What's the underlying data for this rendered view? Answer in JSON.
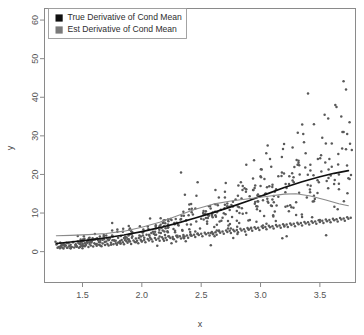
{
  "chart_data": {
    "type": "scatter",
    "title": "",
    "xlabel": "x",
    "ylabel": "y",
    "xlim": [
      1.18,
      3.8
    ],
    "ylim": [
      -8,
      63
    ],
    "grid": false,
    "xticks": [
      "1.5",
      "2.0",
      "2.5",
      "3.0",
      "3.5"
    ],
    "xtick_values": [
      1.5,
      2.0,
      2.5,
      3.0,
      3.5
    ],
    "yticks": [
      "0",
      "10",
      "20",
      "30",
      "40",
      "50",
      "60"
    ],
    "ytick_values": [
      0,
      10,
      20,
      30,
      40,
      50,
      60
    ],
    "legend": {
      "position": "top-left",
      "entries": [
        {
          "label": "True Derivative of Cond Mean",
          "color": "#101010",
          "marker": "square"
        },
        {
          "label": "Est Derivative of Cond Mean",
          "color": "#7a7a7a",
          "marker": "square"
        }
      ]
    },
    "point_color": "#595959",
    "point_radius": 1.25,
    "series": [
      {
        "name": "True Derivative of Cond Mean",
        "type": "line",
        "color": "#101010",
        "width": 1.7,
        "x": [
          1.28,
          1.4,
          1.55,
          1.7,
          1.85,
          2.0,
          2.15,
          2.3,
          2.45,
          2.6,
          2.75,
          2.9,
          3.05,
          3.2,
          3.35,
          3.5,
          3.62,
          3.74
        ],
        "y": [
          2.1,
          2.5,
          3.0,
          3.6,
          4.3,
          5.2,
          6.2,
          7.4,
          8.7,
          10.1,
          11.6,
          13.2,
          14.9,
          16.6,
          18.1,
          19.4,
          20.3,
          21.0
        ]
      },
      {
        "name": "Est Derivative of Cond Mean",
        "type": "line",
        "color": "#8a8a8a",
        "width": 1.1,
        "x": [
          1.28,
          1.4,
          1.55,
          1.7,
          1.85,
          2.0,
          2.15,
          2.3,
          2.45,
          2.6,
          2.75,
          2.9,
          3.05,
          3.2,
          3.3,
          3.42,
          3.55,
          3.66,
          3.74
        ],
        "y": [
          4.1,
          4.2,
          4.4,
          4.7,
          5.3,
          6.3,
          7.6,
          9.3,
          11.0,
          12.3,
          13.1,
          13.7,
          14.3,
          14.9,
          15.0,
          14.4,
          13.4,
          12.4,
          11.9
        ]
      }
    ],
    "scatter": {
      "n": 500,
      "description": "Heteroscedastic fan: spread increases with x",
      "x": [
        1.29,
        1.3,
        1.31,
        1.32,
        1.33,
        1.34,
        1.34,
        1.35,
        1.36,
        1.37,
        1.38,
        1.39,
        1.4,
        1.4,
        1.41,
        1.42,
        1.43,
        1.44,
        1.45,
        1.46,
        1.47,
        1.48,
        1.49,
        1.5,
        1.5,
        1.51,
        1.52,
        1.53,
        1.54,
        1.55,
        1.56,
        1.57,
        1.58,
        1.59,
        1.6,
        1.61,
        1.62,
        1.63,
        1.64,
        1.65,
        1.66,
        1.67,
        1.68,
        1.69,
        1.7,
        1.71,
        1.72,
        1.73,
        1.74,
        1.75,
        1.76,
        1.77,
        1.78,
        1.79,
        1.8,
        1.81,
        1.82,
        1.83,
        1.84,
        1.85,
        1.86,
        1.87,
        1.88,
        1.89,
        1.9,
        1.91,
        1.92,
        1.93,
        1.94,
        1.95,
        1.96,
        1.97,
        1.98,
        1.99,
        2.0,
        2.01,
        2.02,
        2.03,
        2.04,
        2.05,
        2.06,
        2.07,
        2.08,
        2.09,
        2.1,
        2.11,
        2.12,
        2.13,
        2.14,
        2.15,
        2.16,
        2.17,
        2.18,
        2.19,
        2.2,
        2.21,
        2.22,
        2.23,
        2.24,
        2.25,
        2.26,
        2.27,
        2.28,
        2.29,
        2.3,
        2.31,
        2.32,
        2.33,
        2.34,
        2.35,
        2.36,
        2.37,
        2.38,
        2.39,
        2.4,
        2.41,
        2.42,
        2.43,
        2.44,
        2.45,
        2.46,
        2.47,
        2.48,
        2.49,
        2.5,
        2.51,
        2.52,
        2.53,
        2.54,
        2.55,
        2.56,
        2.57,
        2.58,
        2.59,
        2.6,
        2.61,
        2.62,
        2.63,
        2.64,
        2.65,
        2.66,
        2.67,
        2.68,
        2.69,
        2.7,
        2.71,
        2.72,
        2.73,
        2.74,
        2.75,
        2.76,
        2.77,
        2.78,
        2.79,
        2.8,
        2.81,
        2.82,
        2.83,
        2.84,
        2.85,
        2.86,
        2.87,
        2.88,
        2.89,
        2.9,
        2.91,
        2.92,
        2.93,
        2.94,
        2.95,
        2.96,
        2.97,
        2.98,
        2.99,
        3.0,
        3.01,
        3.02,
        3.03,
        3.04,
        3.05,
        3.06,
        3.07,
        3.08,
        3.09,
        3.1,
        3.11,
        3.12,
        3.13,
        3.14,
        3.15,
        3.16,
        3.17,
        3.18,
        3.19,
        3.2,
        3.21,
        3.22,
        3.23,
        3.24,
        3.25,
        3.26,
        3.27,
        3.28,
        3.29,
        3.3,
        3.31,
        3.32,
        3.33,
        3.34,
        3.35,
        3.36,
        3.37,
        3.38,
        3.39,
        3.4,
        3.41,
        3.42,
        3.43,
        3.44,
        3.45,
        3.46,
        3.47,
        3.48,
        3.49,
        3.5,
        3.51,
        3.52,
        3.53,
        3.54,
        3.55,
        3.56,
        3.57,
        3.58,
        3.59,
        3.6,
        3.61,
        3.62,
        3.63,
        3.64,
        3.65,
        3.66,
        3.67,
        3.68,
        3.69,
        3.7,
        3.71,
        3.72,
        3.73,
        3.74,
        3.75,
        3.76
      ],
      "y": [
        1.0,
        1.2,
        0.9,
        1.5,
        1.1,
        2.0,
        0.8,
        1.3,
        1.6,
        1.0,
        2.2,
        1.4,
        0.9,
        1.8,
        1.2,
        2.4,
        1.1,
        1.7,
        1.3,
        2.6,
        1.0,
        1.9,
        1.5,
        2.1,
        0.9,
        2.8,
        1.4,
        1.8,
        2.3,
        1.2,
        2.0,
        1.6,
        2.9,
        1.3,
        2.2,
        1.9,
        1.5,
        3.0,
        1.8,
        2.4,
        1.4,
        2.1,
        3.2,
        1.7,
        2.6,
        2.0,
        1.6,
        3.4,
        2.3,
        7.4,
        1.9,
        2.8,
        2.2,
        1.8,
        3.6,
        2.5,
        2.1,
        3.0,
        2.4,
        1.9,
        3.8,
        2.7,
        2.3,
        3.2,
        2.6,
        2.0,
        4.0,
        2.9,
        2.5,
        3.4,
        2.8,
        2.2,
        4.2,
        3.1,
        2.7,
        5.0,
        3.0,
        2.4,
        4.4,
        3.3,
        2.9,
        3.6,
        3.2,
        2.6,
        4.6,
        3.5,
        3.1,
        1.5,
        3.4,
        2.8,
        4.8,
        3.7,
        3.3,
        5.2,
        3.6,
        3.0,
        8.3,
        3.9,
        3.5,
        2.2,
        3.8,
        3.2,
        5.4,
        4.1,
        3.7,
        6.8,
        4.0,
        3.4,
        5.6,
        4.3,
        3.9,
        2.7,
        4.2,
        3.6,
        5.8,
        4.5,
        4.1,
        9.6,
        4.4,
        3.8,
        14.5,
        4.7,
        4.3,
        6.0,
        4.6,
        4.0,
        10.5,
        4.9,
        4.5,
        7.2,
        4.8,
        4.2,
        11.2,
        5.1,
        4.7,
        6.4,
        5.0,
        4.4,
        12.0,
        5.3,
        4.9,
        8.0,
        5.2,
        4.6,
        15.5,
        5.5,
        5.1,
        6.8,
        5.4,
        4.8,
        9.0,
        5.7,
        5.3,
        13.5,
        5.6,
        5.0,
        7.4,
        5.9,
        5.5,
        17.0,
        5.8,
        5.2,
        10.0,
        6.1,
        5.7,
        8.2,
        6.0,
        5.4,
        16.0,
        6.3,
        5.9,
        11.0,
        6.2,
        5.6,
        19.5,
        6.5,
        6.1,
        9.2,
        6.4,
        5.8,
        13.0,
        6.7,
        6.3,
        22.0,
        6.6,
        6.0,
        10.4,
        6.9,
        6.5,
        14.2,
        6.8,
        6.2,
        24.5,
        7.1,
        6.7,
        11.6,
        7.0,
        6.4,
        17.5,
        7.3,
        6.9,
        27.0,
        7.2,
        6.6,
        12.8,
        7.5,
        7.1,
        20.0,
        7.4,
        6.8,
        30.5,
        7.7,
        7.3,
        14.0,
        7.6,
        7.0,
        22.5,
        7.9,
        7.5,
        33.0,
        7.8,
        7.2,
        15.2,
        8.1,
        7.7,
        25.0,
        8.0,
        7.4,
        35.5,
        8.3,
        7.9,
        16.4,
        8.2,
        7.6,
        28.0,
        8.5,
        8.1,
        38.0,
        8.4,
        7.8,
        17.6,
        8.7,
        8.3,
        31.0,
        8.6,
        8.0,
        42.0,
        8.9,
        8.5,
        18.8,
        8.8,
        8.2,
        34.0,
        9.1,
        8.7,
        52.0,
        9.0,
        8.4,
        20.0,
        9.3,
        8.9,
        36.0,
        9.2,
        8.6,
        56.5,
        9.5,
        9.1,
        21.2,
        9.4,
        8.8,
        38.5,
        9.7,
        9.3,
        23.0,
        9.6,
        9.0,
        31.5,
        9.9,
        9.5,
        25.0,
        9.8,
        9.2,
        33.5,
        10.1,
        9.7
      ],
      "x2": [
        1.35,
        1.42,
        1.48,
        1.55,
        1.62,
        1.7,
        1.78,
        1.85,
        1.92,
        2.0,
        2.08,
        2.15,
        2.22,
        2.3,
        2.38,
        2.45,
        2.52,
        2.6,
        2.68,
        2.75,
        2.82,
        2.9,
        2.98,
        3.05,
        3.12,
        3.2,
        3.28,
        3.35,
        3.42,
        3.5,
        3.58,
        3.65,
        3.72,
        1.4,
        1.52,
        1.65,
        1.75,
        1.88,
        1.95,
        2.05,
        2.12,
        2.25,
        2.35,
        2.42,
        2.55,
        2.65,
        2.72,
        2.85,
        2.95,
        3.02,
        3.15,
        3.25,
        3.32,
        3.45,
        3.55,
        3.62,
        3.7,
        1.45,
        1.58,
        1.68,
        1.82,
        1.9,
        2.02,
        2.18,
        2.28,
        2.4,
        2.5,
        2.58,
        2.7,
        2.8,
        2.92,
        3.0,
        3.1,
        3.18,
        3.3,
        3.38,
        3.48,
        3.6,
        3.68,
        3.75,
        2.33,
        2.62,
        2.88,
        3.08,
        3.22,
        3.4,
        3.52,
        3.64,
        3.73,
        2.47,
        2.77,
        3.06,
        3.26,
        3.44,
        3.57,
        3.66,
        3.74
      ],
      "y2": [
        1.8,
        2.5,
        1.2,
        3.1,
        2.0,
        4.2,
        2.8,
        3.5,
        5.0,
        2.6,
        4.8,
        3.9,
        6.2,
        4.1,
        7.0,
        5.2,
        9.5,
        4.5,
        8.8,
        6.0,
        11.5,
        5.8,
        13.0,
        7.2,
        15.5,
        6.5,
        18.0,
        9.0,
        21.0,
        8.2,
        24.0,
        11.0,
        26.5,
        0.9,
        2.2,
        1.6,
        5.5,
        3.2,
        2.4,
        6.5,
        4.4,
        8.2,
        3.8,
        10.2,
        7.8,
        5.5,
        12.5,
        9.8,
        16.5,
        6.8,
        19.5,
        12.0,
        23.0,
        14.5,
        28.0,
        17.5,
        31.0,
        1.4,
        2.9,
        4.0,
        2.1,
        6.0,
        3.6,
        7.5,
        5.0,
        11.0,
        8.5,
        4.8,
        14.0,
        10.5,
        6.2,
        17.0,
        13.5,
        20.5,
        9.5,
        25.5,
        18.5,
        22.0,
        35.0,
        33.5,
        20.5,
        16.0,
        22.5,
        24.0,
        4.0,
        41.0,
        29.5,
        37.5,
        30.5,
        18.0,
        3.5,
        27.5,
        11.5,
        13.0,
        34.5,
        20.0,
        19.0
      ]
    }
  },
  "axes": {
    "x_title": "x",
    "y_title": "y"
  }
}
